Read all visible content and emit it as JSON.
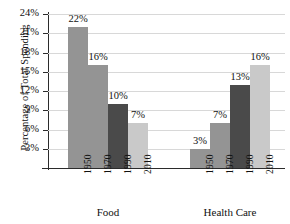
{
  "chart_data": {
    "type": "bar",
    "title": "",
    "xlabel": "",
    "ylabel": "Percentage of Total Spending",
    "ylim": [
      0,
      24
    ],
    "ytick_labels": [
      "24%",
      "21%",
      "18%",
      "15%",
      "12%",
      "9%",
      "6%",
      "3%"
    ],
    "ytick_values": [
      24,
      21,
      18,
      15,
      12,
      9,
      6,
      3
    ],
    "grid": true,
    "legend": "none",
    "categories": [
      "1950",
      "1970",
      "1990",
      "2010"
    ],
    "groups": [
      {
        "name": "Food",
        "values": [
          22,
          16,
          10,
          7
        ],
        "value_labels": [
          "22%",
          "16%",
          "10%",
          "7%"
        ]
      },
      {
        "name": "Health Care",
        "values": [
          3,
          7,
          13,
          16
        ],
        "value_labels": [
          "3%",
          "7%",
          "13%",
          "16%"
        ]
      }
    ],
    "series_colors": [
      "#949494",
      "#949494",
      "#4a4a4a",
      "#c9c9c9"
    ],
    "axis_color": "#2b2b2b",
    "grid_color": "#d8d8d8",
    "background": "#ffffff"
  }
}
